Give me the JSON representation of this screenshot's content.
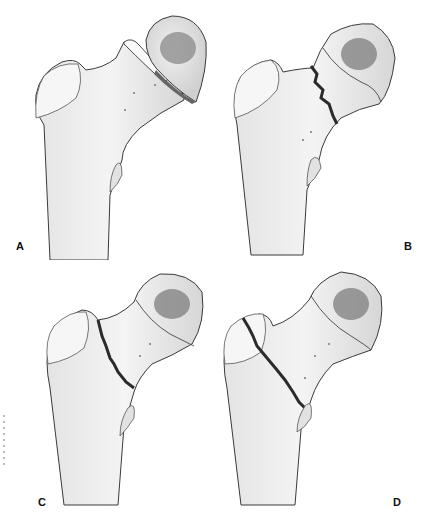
{
  "figure": {
    "panels": [
      {
        "label": "A",
        "description": "Subcapital displaced fracture — femoral head separated from neck"
      },
      {
        "label": "B",
        "description": "Subcapital fracture with jagged fracture line near head"
      },
      {
        "label": "C",
        "description": "Transcervical fracture through mid neck"
      },
      {
        "label": "D",
        "description": "Basicervical / intertrochanteric oblique fracture line"
      }
    ]
  },
  "colors": {
    "background": "#ffffff",
    "bone": "#ececec",
    "bone_shadow": "#c8c8c8",
    "outline": "#3a3a3a",
    "fracture": "#2b2b2b",
    "head_fovea": "#8a8a8a"
  }
}
